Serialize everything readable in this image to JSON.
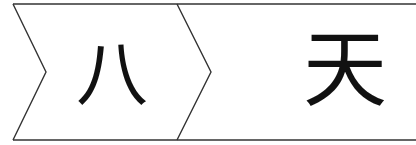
{
  "diagram": {
    "type": "chevron-sequence",
    "stroke_color": "#333333",
    "cells": [
      {
        "label": "八"
      },
      {
        "label": "天"
      }
    ]
  }
}
